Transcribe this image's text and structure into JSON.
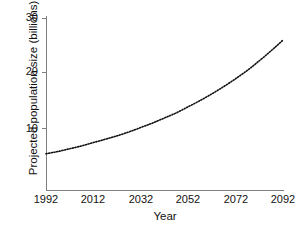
{
  "chart_data": {
    "type": "line",
    "title": "",
    "subtitle": "",
    "xlabel": "Year",
    "ylabel": "Projected population size (billions)",
    "xlim": [
      1992,
      2092
    ],
    "ylim": [
      0,
      30
    ],
    "xticks": [
      "1992",
      "2012",
      "2032",
      "2052",
      "2072",
      "2092"
    ],
    "xtick_values": [
      1992,
      2012,
      2032,
      2052,
      2072,
      2092
    ],
    "yticks": [
      "10",
      "20",
      "30"
    ],
    "ytick_values": [
      10,
      20,
      30
    ],
    "grid": false,
    "legend": null,
    "annotations": [],
    "series": [
      {
        "name": "Projected population size",
        "style": "dotted",
        "color": "#111111",
        "x": [
          1992,
          1997,
          2002,
          2007,
          2012,
          2017,
          2022,
          2027,
          2032,
          2037,
          2042,
          2047,
          2052,
          2057,
          2062,
          2067,
          2072,
          2077,
          2082,
          2087,
          2092
        ],
        "values": [
          5.4,
          5.8,
          6.3,
          6.8,
          7.4,
          8.0,
          8.6,
          9.3,
          10.1,
          10.9,
          11.8,
          12.7,
          13.8,
          14.9,
          16.1,
          17.4,
          18.8,
          20.3,
          22.0,
          23.8,
          25.7
        ]
      }
    ]
  },
  "axes": {
    "y_title": "Projected population size (billions)",
    "x_title": "Year",
    "y_tick_labels": [
      "30",
      "20",
      "10"
    ],
    "x_tick_labels": [
      "1992",
      "2012",
      "2032",
      "2052",
      "2072",
      "2092"
    ]
  },
  "colors": {
    "axis": "#808080",
    "text": "#111111",
    "curve": "#111111",
    "background": "#ffffff"
  }
}
